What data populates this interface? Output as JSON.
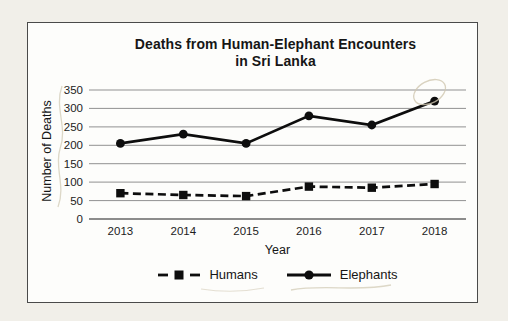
{
  "page": {
    "background": "#f1efe9"
  },
  "figure": {
    "background": "#fdfdfb",
    "border_color": "#4a4a4a",
    "text_color": "#161616"
  },
  "chart_data": {
    "type": "line",
    "title": "Deaths from Human-Elephant Encounters in Sri Lanka",
    "title_lines": [
      "Deaths from Human-Elephant Encounters",
      "in Sri Lanka"
    ],
    "xlabel": "Year",
    "ylabel": "Number of Deaths",
    "categories": [
      "2013",
      "2014",
      "2015",
      "2016",
      "2017",
      "2018"
    ],
    "series": [
      {
        "name": "Humans",
        "values": [
          70,
          65,
          62,
          88,
          85,
          95
        ],
        "line_style": "dashed",
        "marker": "square",
        "color": "#0d0d0d"
      },
      {
        "name": "Elephants",
        "values": [
          205,
          230,
          205,
          280,
          255,
          320
        ],
        "line_style": "solid",
        "marker": "circle",
        "color": "#0d0d0d"
      }
    ],
    "ylim": [
      0,
      350
    ],
    "ytick_step": 50,
    "ytick_labels": [
      "0",
      "50",
      "100",
      "150",
      "200",
      "250",
      "300",
      "350"
    ],
    "grid": true,
    "gridline_color": "#919191",
    "axis_line_color": "#666666",
    "legend_position": "bottom"
  },
  "hand_marks": {
    "color": "#cfc7b0",
    "items": [
      "pencil-oval-around-2018-elephants-point",
      "pencil-squiggle-left-of-y-axis-labels",
      "pencil-squiggle-under-humans-legend",
      "pencil-squiggle-under-elephants-legend"
    ]
  }
}
